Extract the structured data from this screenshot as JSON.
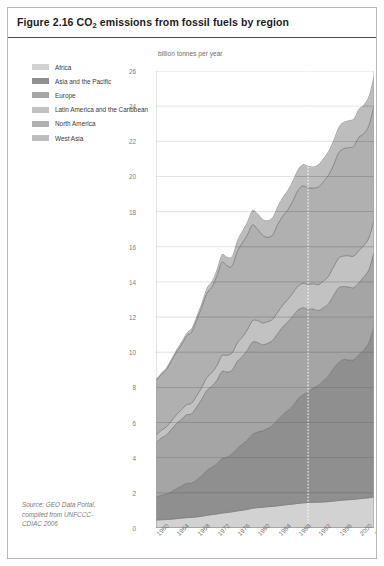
{
  "figure": {
    "title_prefix": "Figure 2.16 CO",
    "title_sub": "2",
    "title_suffix": " emissions from fossil fuels by region"
  },
  "legend": {
    "items": [
      {
        "label": "Africa",
        "color": "#d2d2d2"
      },
      {
        "label": "Asia and the Pacific",
        "color": "#8f8f8f"
      },
      {
        "label": "Europe",
        "color": "#a5a5a5"
      },
      {
        "label": "Latin America and the Caribbean",
        "color": "#c2c2c2"
      },
      {
        "label": "North America",
        "color": "#b0b0b0"
      },
      {
        "label": "West Asia",
        "color": "#bdbdbd"
      }
    ]
  },
  "source": {
    "line1": "Source: GEO Data Portal,",
    "line2": "compiled from UNFCCC-",
    "line3": "CDIAC 2006"
  },
  "chart_data": {
    "type": "area",
    "stacked": true,
    "title": "Figure 2.16 CO2 emissions from fossil fuels by region",
    "xlabel": "",
    "ylabel": "billion tonnes per year",
    "ylim": [
      0,
      26
    ],
    "ytick_step": 2,
    "yticks": [
      0,
      2,
      4,
      6,
      8,
      10,
      12,
      14,
      16,
      18,
      20,
      22,
      24,
      26
    ],
    "xlim": [
      1960,
      2003
    ],
    "xticks": [
      1960,
      1964,
      1968,
      1972,
      1976,
      1980,
      1984,
      1988,
      1992,
      1996,
      2000,
      2003
    ],
    "grid": "horizontal",
    "legend_position": "top-left",
    "annotations": [
      {
        "type": "vertical-dotted-line",
        "x": 1990,
        "color": "#ffffff"
      }
    ],
    "x": [
      1960,
      1961,
      1962,
      1963,
      1964,
      1965,
      1966,
      1967,
      1968,
      1969,
      1970,
      1971,
      1972,
      1973,
      1974,
      1975,
      1976,
      1977,
      1978,
      1979,
      1980,
      1981,
      1982,
      1983,
      1984,
      1985,
      1986,
      1987,
      1988,
      1989,
      1990,
      1991,
      1992,
      1993,
      1994,
      1995,
      1996,
      1997,
      1998,
      1999,
      2000,
      2001,
      2002,
      2003
    ],
    "series": [
      {
        "name": "Africa",
        "color": "#d2d2d2",
        "values": [
          0.45,
          0.47,
          0.48,
          0.5,
          0.53,
          0.56,
          0.59,
          0.6,
          0.63,
          0.67,
          0.72,
          0.76,
          0.8,
          0.85,
          0.88,
          0.92,
          0.97,
          1.01,
          1.06,
          1.12,
          1.16,
          1.18,
          1.21,
          1.23,
          1.26,
          1.3,
          1.33,
          1.36,
          1.4,
          1.43,
          1.45,
          1.46,
          1.47,
          1.48,
          1.5,
          1.53,
          1.56,
          1.59,
          1.61,
          1.63,
          1.66,
          1.69,
          1.72,
          1.77
        ]
      },
      {
        "name": "Asia and the Pacific",
        "color": "#8f8f8f",
        "values": [
          1.3,
          1.4,
          1.45,
          1.55,
          1.7,
          1.82,
          1.95,
          1.95,
          2.1,
          2.3,
          2.55,
          2.7,
          2.85,
          3.1,
          3.15,
          3.3,
          3.55,
          3.75,
          3.95,
          4.2,
          4.3,
          4.35,
          4.45,
          4.6,
          4.9,
          5.15,
          5.35,
          5.6,
          5.95,
          6.15,
          6.3,
          6.5,
          6.65,
          6.9,
          7.15,
          7.55,
          7.85,
          8.0,
          7.95,
          7.95,
          8.2,
          8.45,
          8.85,
          9.7
        ]
      },
      {
        "name": "Europe",
        "color": "#a5a5a5",
        "values": [
          3.1,
          3.25,
          3.35,
          3.55,
          3.7,
          3.8,
          3.9,
          3.95,
          4.15,
          4.35,
          4.55,
          4.6,
          4.75,
          4.95,
          4.85,
          4.75,
          4.95,
          5.0,
          5.1,
          5.25,
          5.1,
          4.9,
          4.85,
          4.85,
          4.9,
          5.0,
          5.05,
          5.1,
          5.05,
          4.95,
          4.7,
          4.5,
          4.25,
          4.15,
          4.1,
          4.15,
          4.25,
          4.15,
          4.15,
          4.1,
          4.1,
          4.15,
          4.15,
          4.25
        ]
      },
      {
        "name": "Latin America and the Caribbean",
        "color": "#c2c2c2",
        "values": [
          0.42,
          0.44,
          0.46,
          0.48,
          0.51,
          0.54,
          0.57,
          0.6,
          0.64,
          0.68,
          0.73,
          0.78,
          0.84,
          0.91,
          0.95,
          0.99,
          1.05,
          1.1,
          1.16,
          1.22,
          1.25,
          1.24,
          1.23,
          1.2,
          1.22,
          1.24,
          1.28,
          1.32,
          1.36,
          1.39,
          1.41,
          1.44,
          1.48,
          1.52,
          1.57,
          1.62,
          1.68,
          1.74,
          1.78,
          1.79,
          1.82,
          1.8,
          1.8,
          1.83
        ]
      },
      {
        "name": "North America",
        "color": "#b0b0b0",
        "values": [
          3.1,
          3.15,
          3.25,
          3.4,
          3.55,
          3.7,
          3.9,
          4.05,
          4.3,
          4.55,
          4.8,
          4.85,
          5.1,
          5.3,
          5.1,
          4.95,
          5.2,
          5.35,
          5.4,
          5.45,
          5.2,
          5.0,
          4.8,
          4.8,
          5.0,
          5.05,
          5.1,
          5.25,
          5.45,
          5.55,
          5.5,
          5.45,
          5.55,
          5.65,
          5.75,
          5.8,
          6.0,
          6.1,
          6.15,
          6.25,
          6.45,
          6.35,
          6.4,
          6.5
        ]
      },
      {
        "name": "West Asia",
        "color": "#bdbdbd",
        "values": [
          0.1,
          0.11,
          0.12,
          0.13,
          0.15,
          0.17,
          0.19,
          0.21,
          0.24,
          0.27,
          0.31,
          0.35,
          0.4,
          0.46,
          0.5,
          0.56,
          0.63,
          0.7,
          0.77,
          0.85,
          0.9,
          0.93,
          0.97,
          1.01,
          1.05,
          1.09,
          1.13,
          1.17,
          1.2,
          1.23,
          1.25,
          1.22,
          1.28,
          1.33,
          1.38,
          1.42,
          1.47,
          1.52,
          1.56,
          1.58,
          1.62,
          1.66,
          1.7,
          1.75
        ]
      }
    ]
  }
}
